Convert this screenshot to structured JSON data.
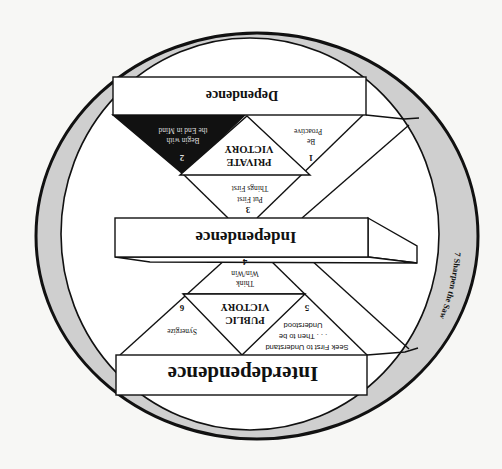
{
  "diagram": {
    "orientation": "rotated-180",
    "colors": {
      "background": "#f7f7f5",
      "ring": "#cfcfcf",
      "line": "#111111",
      "highlight_fill": "#111111",
      "box_fill": "#ffffff"
    },
    "levels": {
      "dependence": "Dependence",
      "independence": "Independence",
      "interdependence": "Interdependence"
    },
    "victories": {
      "private": {
        "line1": "PRIVATE",
        "line2": "VICTORY"
      },
      "public": {
        "line1": "PUBLIC",
        "line2": "VICTORY"
      }
    },
    "habits": [
      {
        "number": "1",
        "lines": [
          "Be",
          "Proactive"
        ]
      },
      {
        "number": "2",
        "lines": [
          "Begin with",
          "the End in Mind"
        ],
        "highlighted": true
      },
      {
        "number": "3",
        "lines": [
          "Put First",
          "Things First"
        ]
      },
      {
        "number": "4",
        "lines": [
          "Think",
          "Win/Win"
        ]
      },
      {
        "number": "5",
        "lines": [
          "Seek First to Understand",
          ". . . Then to be",
          "Understood"
        ]
      },
      {
        "number": "6",
        "lines": [
          "Synergize"
        ]
      },
      {
        "number": "7",
        "lines": [
          "Sharpen the Saw"
        ]
      }
    ],
    "ring_label": "7  Sharpen the Saw"
  }
}
